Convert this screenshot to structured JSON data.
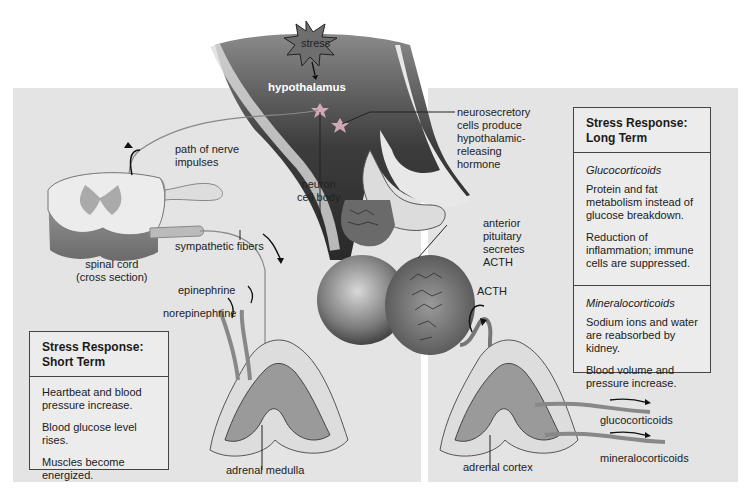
{
  "diagram": {
    "top_labels": {
      "stress": "stress",
      "hypothalamus": "hypothalamus",
      "neurosecretory": [
        "neurosecretory",
        "cells produce",
        "hypothalamic-",
        "releasing",
        "hormone"
      ],
      "neuron_cell_body": [
        "neuron",
        "cell body"
      ],
      "anterior_pituitary": [
        "anterior",
        "pituitary",
        "secretes",
        "ACTH"
      ],
      "acth": "ACTH"
    },
    "left_labels": {
      "path_of_nerve_impulses": [
        "path of nerve",
        "impulses"
      ],
      "spinal_cord": [
        "spinal cord",
        "(cross section)"
      ],
      "sympathetic_fibers": "sympathetic fibers",
      "epinephrine": "epinephrine",
      "norepinephrine": "norepinephrine",
      "adrenal_medulla": "adrenal medulla"
    },
    "right_labels": {
      "adrenal_cortex": "adrenal cortex",
      "glucocorticoids": "glucocorticoids",
      "mineralocorticoids": "mineralocorticoids"
    },
    "short_term_box": {
      "title": [
        "Stress Response:",
        "Short Term"
      ],
      "items": [
        "Heartbeat and blood pressure increase.",
        "Blood glucose level rises.",
        "Muscles become energized."
      ]
    },
    "long_term_box": {
      "title": [
        "Stress Response:",
        "Long Term"
      ],
      "sections": [
        {
          "heading": "Glucocorticoids",
          "items": [
            "Protein and fat metabolism instead of glucose breakdown.",
            "Reduction of inflammation; immune cells are suppressed."
          ]
        },
        {
          "heading": "Mineralocorticoids",
          "items": [
            "Sodium ions and water are reabsorbed by kidney.",
            "Blood volume and pressure increase."
          ]
        }
      ]
    },
    "colors": {
      "panel_bg": "#e4e4e4",
      "brain_dark": "#4a4a4a",
      "tissue_light": "#d0d0d0",
      "box_border": "#444444"
    }
  }
}
